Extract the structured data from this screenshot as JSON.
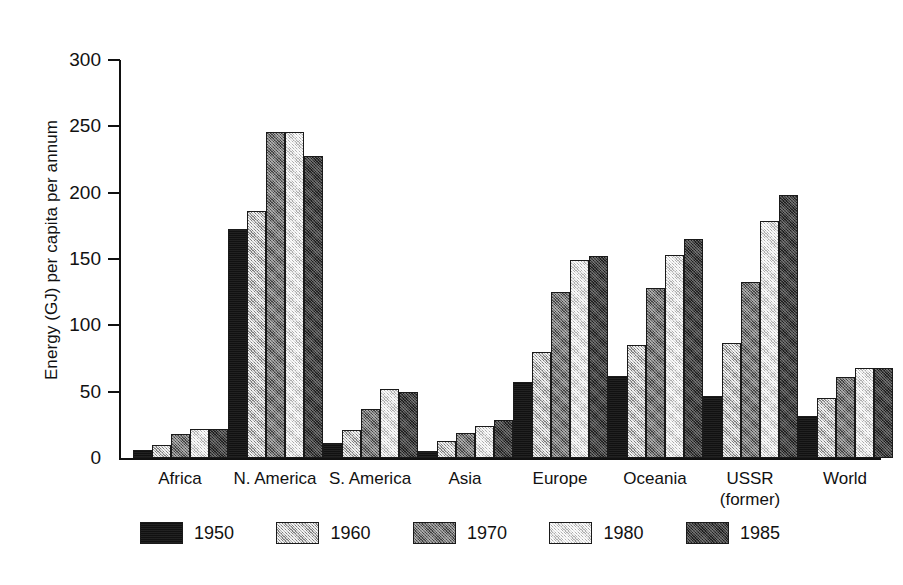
{
  "chart_data": {
    "type": "bar",
    "title": "",
    "xlabel": "",
    "ylabel": "Energy (GJ) per capita per annum",
    "ylim": [
      0,
      300
    ],
    "y_ticks": [
      0,
      50,
      100,
      150,
      200,
      250,
      300
    ],
    "grid": false,
    "legend_position": "bottom",
    "categories": [
      "Africa",
      "N. America",
      "S. America",
      "Asia",
      "Europe",
      "Oceania",
      "USSR (former)",
      "World"
    ],
    "category_lines": [
      [
        "Africa",
        ""
      ],
      [
        "N. America",
        ""
      ],
      [
        "S. America",
        ""
      ],
      [
        "Asia",
        ""
      ],
      [
        "Europe",
        ""
      ],
      [
        "Oceania",
        ""
      ],
      [
        "USSR",
        "(former)"
      ],
      [
        "World",
        ""
      ]
    ],
    "series": [
      {
        "name": "1950",
        "color": "#111111",
        "values": [
          6,
          173,
          11,
          5,
          57,
          62,
          47,
          32
        ]
      },
      {
        "name": "1960",
        "color": "#b4b4b4",
        "values": [
          10,
          186,
          21,
          13,
          80,
          85,
          87,
          45
        ]
      },
      {
        "name": "1970",
        "color": "#6e6e6e",
        "values": [
          18,
          246,
          37,
          19,
          125,
          128,
          133,
          61
        ]
      },
      {
        "name": "1980",
        "color": "#dcdcdc",
        "values": [
          22,
          246,
          52,
          24,
          149,
          153,
          179,
          68
        ]
      },
      {
        "name": "1985",
        "color": "#3c3c3c",
        "values": [
          22,
          228,
          50,
          29,
          152,
          165,
          198,
          68
        ]
      }
    ]
  },
  "legend": {
    "entries": [
      {
        "label": "1950"
      },
      {
        "label": "1960"
      },
      {
        "label": "1970"
      },
      {
        "label": "1980"
      },
      {
        "label": "1985"
      }
    ]
  }
}
